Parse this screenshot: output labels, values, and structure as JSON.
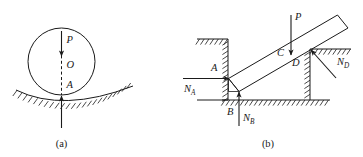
{
  "figure": {
    "background_color": "#ffffff",
    "ink_color": "#1a1a1a",
    "panels": [
      {
        "id": "panel-a",
        "caption": "(a)",
        "description": "Circular cylinder resting in a concave hatched surface",
        "labels": {
          "load": "P",
          "center": "O",
          "contact_point": "A"
        },
        "forces": [
          {
            "name": "P",
            "direction": "down",
            "applied_at": "top of circle toward center"
          },
          {
            "name": "reaction",
            "direction": "up",
            "applied_at": "A",
            "unlabeled": true
          }
        ]
      },
      {
        "id": "panel-b",
        "caption": "(b)",
        "description": "Inclined rigid bar wedged between a vertical wall and a step, with reactions at A, B and D",
        "labels": {
          "load": "P",
          "load_point": "C",
          "contact_a": "A",
          "contact_b": "B",
          "contact_d": "D"
        },
        "forces": [
          {
            "name": "N",
            "subscript": "A",
            "direction": "right",
            "applied_at": "A"
          },
          {
            "name": "N",
            "subscript": "B",
            "direction": "up",
            "applied_at": "B"
          },
          {
            "name": "N",
            "subscript": "D",
            "direction": "up-left",
            "applied_at": "D"
          },
          {
            "name": "P",
            "direction": "down",
            "applied_at": "C"
          }
        ]
      }
    ]
  }
}
